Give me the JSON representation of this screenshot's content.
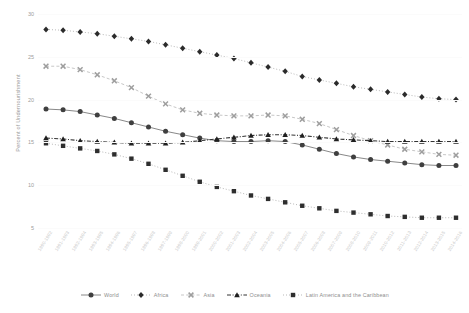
{
  "chart_data": {
    "type": "line",
    "title": "",
    "xlabel": "",
    "ylabel": "Percent of Undernourishment",
    "ylim": [
      5,
      30
    ],
    "yticks": [
      30,
      25,
      20,
      15,
      10,
      5
    ],
    "grid": false,
    "legend_position": "bottom",
    "categories": [
      "1990-1992",
      "1991-1993",
      "1992-1994",
      "1993-1995",
      "1994-1996",
      "1995-1997",
      "1996-1998",
      "1997-1999",
      "1998-2000",
      "1999-2001",
      "2000-2002",
      "2001-2003",
      "2002-2004",
      "2003-2005",
      "2004-2006",
      "2005-2007",
      "2006-2008",
      "2007-2009",
      "2008-2010",
      "2009-2011",
      "2010-2012",
      "2011-2013",
      "2012-2014",
      "2013-2015",
      "2014-2016"
    ],
    "series": [
      {
        "name": "World",
        "marker": "circle",
        "line_style": "solid",
        "color": "#3f3f3f",
        "values": [
          18.9,
          18.8,
          18.6,
          18.2,
          17.8,
          17.3,
          16.8,
          16.3,
          15.9,
          15.5,
          15.2,
          15.1,
          15.1,
          15.2,
          15.1,
          14.7,
          14.2,
          13.7,
          13.3,
          13.0,
          12.8,
          12.6,
          12.4,
          12.3,
          12.3
        ]
      },
      {
        "name": "Africa",
        "marker": "diamond",
        "line_style": "dotted",
        "color": "#2b2b2b",
        "values": [
          28.2,
          28.1,
          27.9,
          27.7,
          27.4,
          27.1,
          26.8,
          26.4,
          26.0,
          25.6,
          25.2,
          24.8,
          24.3,
          23.8,
          23.3,
          22.7,
          22.3,
          21.9,
          21.5,
          21.2,
          20.9,
          20.6,
          20.3,
          20.1,
          20.0
        ]
      },
      {
        "name": "Asia",
        "marker": "x",
        "line_style": "dashed",
        "color": "#9e9e9e",
        "values": [
          23.9,
          23.9,
          23.5,
          22.9,
          22.2,
          21.4,
          20.4,
          19.5,
          18.8,
          18.4,
          18.2,
          18.1,
          18.1,
          18.2,
          18.1,
          17.7,
          17.2,
          16.5,
          15.8,
          15.2,
          14.7,
          14.2,
          13.9,
          13.6,
          13.5
        ]
      },
      {
        "name": "Oceania",
        "marker": "triangle",
        "line_style": "dashdot",
        "color": "#1f1f1f",
        "values": [
          15.5,
          15.4,
          15.2,
          15.1,
          15.0,
          14.9,
          14.9,
          14.9,
          15.0,
          15.2,
          15.4,
          15.6,
          15.8,
          15.9,
          15.9,
          15.8,
          15.6,
          15.4,
          15.3,
          15.2,
          15.1,
          15.1,
          15.1,
          15.1,
          15.1
        ]
      },
      {
        "name": "Latin America and the Caribbean",
        "marker": "square",
        "line_style": "dotted",
        "color": "#2e2e2e",
        "values": [
          14.9,
          14.6,
          14.3,
          14.0,
          13.6,
          13.1,
          12.5,
          11.8,
          11.1,
          10.4,
          9.8,
          9.3,
          8.8,
          8.4,
          8.0,
          7.6,
          7.3,
          7.0,
          6.8,
          6.6,
          6.4,
          6.3,
          6.2,
          6.2,
          6.2
        ]
      }
    ]
  }
}
